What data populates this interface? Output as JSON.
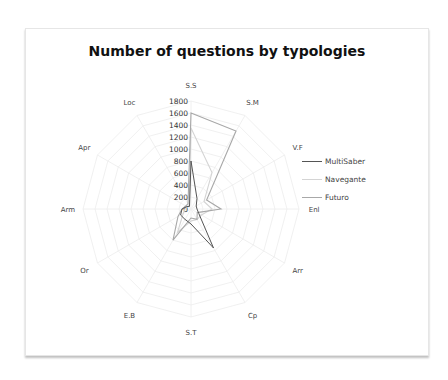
{
  "chart_data": {
    "type": "radar",
    "title": "Number of questions by typologies",
    "categories": [
      "S.S",
      "S.M",
      "V.F",
      "Enl",
      "Arr",
      "Cp",
      "S.T",
      "E.B",
      "Or",
      "Arm",
      "Apr",
      "Loc"
    ],
    "radial_ticks": [
      0,
      200,
      400,
      600,
      800,
      1000,
      1200,
      1400,
      1600,
      1800
    ],
    "rmax": 1800,
    "legend_position": "right",
    "grid": true,
    "series": [
      {
        "name": "MultiSaber",
        "color": "#555555",
        "values": [
          800,
          200,
          100,
          100,
          150,
          750,
          250,
          200,
          200,
          150,
          80,
          50
        ]
      },
      {
        "name": "Navegante",
        "color": "#d4d4d4",
        "values": [
          1350,
          700,
          250,
          350,
          200,
          200,
          200,
          450,
          150,
          100,
          80,
          60
        ]
      },
      {
        "name": "Futuro",
        "color": "#a8a8a8",
        "values": [
          1600,
          1500,
          300,
          500,
          120,
          200,
          150,
          600,
          250,
          150,
          100,
          100
        ]
      }
    ]
  },
  "legend": {
    "items": [
      "MultiSaber",
      "Navegante",
      "Futuro"
    ]
  }
}
